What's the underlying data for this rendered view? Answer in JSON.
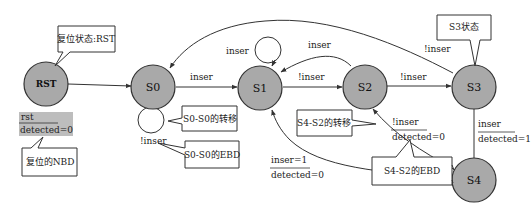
{
  "diagram": {
    "type": "state-machine",
    "states": [
      {
        "id": "RST",
        "label": "RST"
      },
      {
        "id": "S0",
        "label": "S0"
      },
      {
        "id": "S1",
        "label": "S1"
      },
      {
        "id": "S2",
        "label": "S2"
      },
      {
        "id": "S3",
        "label": "S3"
      },
      {
        "id": "S4",
        "label": "S4"
      }
    ],
    "transitions": [
      {
        "from": "RST",
        "to": "S0",
        "label": ""
      },
      {
        "from": "S0",
        "to": "S0",
        "label": "!inser"
      },
      {
        "from": "S0",
        "to": "S1",
        "label": "inser"
      },
      {
        "from": "S1",
        "to": "S1",
        "label": "inser"
      },
      {
        "from": "S1",
        "to": "S2",
        "label": "!inser"
      },
      {
        "from": "S2",
        "to": "S1",
        "label": "inser"
      },
      {
        "from": "S2",
        "to": "S3",
        "label": "!inser"
      },
      {
        "from": "S3",
        "to": "S0",
        "label": "!inser"
      },
      {
        "from": "S3",
        "to": "S4",
        "label": "inser",
        "action": "detected=1"
      },
      {
        "from": "S4",
        "to": "S2",
        "label": "!inser",
        "action": "detected=0"
      },
      {
        "from": "S4",
        "to": "S1",
        "label": "inser=1",
        "action": "detected=0"
      }
    ],
    "notes": {
      "rst_state": "复位状态:RST",
      "reset_nbd": "复位的NBD",
      "s0_s0_transition": "S0-S0的转移",
      "s0_s0_ebd": "S0-S0的EBD",
      "s4_s2_transition": "S4-S2的转移",
      "s4_s2_ebd": "S4-S2的EBD",
      "s3_state": "S3状态"
    },
    "reset_box": {
      "guard": "rst",
      "action": "detected=0"
    },
    "labels": {
      "s0_s1": "inser",
      "s0_self": "!inser",
      "s1_self": "inser",
      "s2_s1": "inser",
      "s1_s2": "!inser",
      "s2_s3": "!inser",
      "s3_s0": "!inser",
      "s3_s4_guard": "inser",
      "s3_s4_action": "detected=1",
      "s4_s2_guard": "!inser",
      "s4_s2_action": "detected=0",
      "s4_s1_guard": "inser=1",
      "s4_s1_action": "detected=0"
    },
    "colors": {
      "node_fill": "#a9a9a9",
      "reset_box_fill": "#bdbdbd",
      "stroke": "#333333"
    }
  }
}
